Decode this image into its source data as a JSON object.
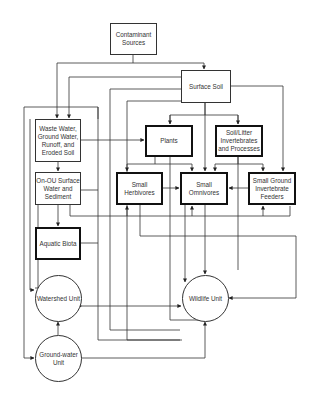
{
  "diagram": {
    "nodes": {
      "contaminant_sources": "Contaminant Sources",
      "surface_soil": "Surface Soil",
      "waste_water": "Waste Water, Ground Water, Runoff, and Eroded Soil",
      "plants": "Plants",
      "soil_litter": "Soil/Litter Invertebrates and Processes",
      "on_ou_surface_water": "On-OU Surface Water and Sediment",
      "small_herbivores": "Small Herbivores",
      "small_omnivores": "Small Omnivores",
      "small_ground_invertebrate_feeders": "Small Ground Invertebrate Feeders",
      "aquatic_biota": "Aquatic Biota",
      "watershed_unit": "Watershed Unit",
      "wildlife_unit": "Wildlife Unit",
      "groundwater_unit": "Ground-water Unit"
    },
    "colors": {
      "line": "#222222",
      "background": "#ffffff"
    }
  }
}
